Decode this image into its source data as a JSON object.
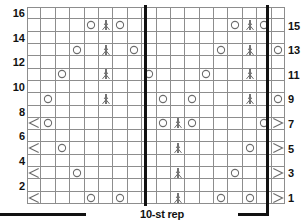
{
  "chart_data": {
    "type": "table",
    "title": "",
    "kind": "knitting-stitch-chart",
    "columns": 18,
    "rows": 16,
    "xlabel": "",
    "ylabel": "",
    "grid": true,
    "repeat": {
      "caption": "10-st rep",
      "stitch_count": 10,
      "start_column": 9,
      "end_column": 18
    },
    "row_labels_left": [
      "16",
      "14",
      "12",
      "10",
      "8",
      "6",
      "4",
      "2"
    ],
    "row_labels_right": [
      "15",
      "13",
      "11",
      "9",
      "7",
      "5",
      "3",
      "1"
    ],
    "legend": {
      "yo": "yarn-over",
      "cdd": "centered-double-decrease",
      "ssk": "left-leaning-decrease",
      "k2tog": "right-leaning-decrease"
    },
    "colors": {
      "grid_line": "#8d8d8d",
      "repeat_line": "#111111",
      "symbol": "#6d6d6d",
      "text": "#111111",
      "background": "#ffffff"
    },
    "row_symbols": [
      {
        "row": 16,
        "cells": []
      },
      {
        "row": 15,
        "cells": [
          {
            "col": 5,
            "sym": "yo"
          },
          {
            "col": 6,
            "sym": "cdd"
          },
          {
            "col": 7,
            "sym": "yo"
          },
          {
            "col": 15,
            "sym": "yo"
          },
          {
            "col": 16,
            "sym": "cdd"
          },
          {
            "col": 17,
            "sym": "yo"
          }
        ]
      },
      {
        "row": 14,
        "cells": []
      },
      {
        "row": 13,
        "cells": [
          {
            "col": 4,
            "sym": "yo"
          },
          {
            "col": 6,
            "sym": "cdd"
          },
          {
            "col": 8,
            "sym": "yo"
          },
          {
            "col": 14,
            "sym": "yo"
          },
          {
            "col": 16,
            "sym": "cdd"
          },
          {
            "col": 18,
            "sym": "yo"
          }
        ]
      },
      {
        "row": 12,
        "cells": []
      },
      {
        "row": 11,
        "cells": [
          {
            "col": 3,
            "sym": "yo"
          },
          {
            "col": 6,
            "sym": "cdd"
          },
          {
            "col": 9,
            "sym": "yo"
          },
          {
            "col": 13,
            "sym": "yo"
          },
          {
            "col": 16,
            "sym": "cdd"
          }
        ]
      },
      {
        "row": 10,
        "cells": []
      },
      {
        "row": 9,
        "cells": [
          {
            "col": 2,
            "sym": "yo"
          },
          {
            "col": 6,
            "sym": "cdd"
          },
          {
            "col": 10,
            "sym": "yo"
          },
          {
            "col": 12,
            "sym": "yo"
          },
          {
            "col": 16,
            "sym": "cdd"
          },
          {
            "col": 18,
            "sym": "yo"
          }
        ]
      },
      {
        "row": 8,
        "cells": []
      },
      {
        "row": 7,
        "cells": [
          {
            "col": 1,
            "sym": "ssk"
          },
          {
            "col": 2,
            "sym": "yo"
          },
          {
            "col": 10,
            "sym": "yo"
          },
          {
            "col": 11,
            "sym": "cdd"
          },
          {
            "col": 12,
            "sym": "yo"
          },
          {
            "col": 17,
            "sym": "yo"
          },
          {
            "col": 18,
            "sym": "k2tog"
          }
        ]
      },
      {
        "row": 6,
        "cells": []
      },
      {
        "row": 5,
        "cells": [
          {
            "col": 1,
            "sym": "ssk"
          },
          {
            "col": 3,
            "sym": "yo"
          },
          {
            "col": 11,
            "sym": "cdd"
          },
          {
            "col": 16,
            "sym": "yo"
          },
          {
            "col": 18,
            "sym": "k2tog"
          }
        ]
      },
      {
        "row": 4,
        "cells": []
      },
      {
        "row": 3,
        "cells": [
          {
            "col": 1,
            "sym": "ssk"
          },
          {
            "col": 4,
            "sym": "yo"
          },
          {
            "col": 11,
            "sym": "cdd"
          },
          {
            "col": 15,
            "sym": "yo"
          },
          {
            "col": 18,
            "sym": "k2tog"
          }
        ]
      },
      {
        "row": 2,
        "cells": []
      },
      {
        "row": 1,
        "cells": [
          {
            "col": 1,
            "sym": "ssk"
          },
          {
            "col": 5,
            "sym": "yo"
          },
          {
            "col": 7,
            "sym": "yo"
          },
          {
            "col": 11,
            "sym": "cdd"
          },
          {
            "col": 14,
            "sym": "yo"
          },
          {
            "col": 16,
            "sym": "yo"
          },
          {
            "col": 18,
            "sym": "k2tog"
          }
        ]
      }
    ]
  }
}
